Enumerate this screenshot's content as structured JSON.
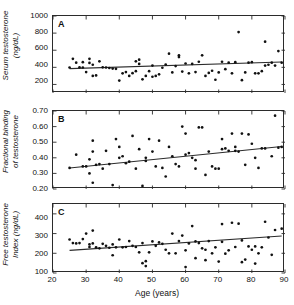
{
  "figure": {
    "xlabel": "Age (years)",
    "xticks": [
      20,
      30,
      40,
      50,
      60,
      70,
      80,
      90
    ],
    "xlim": [
      20,
      90
    ]
  },
  "chart_data": [
    {
      "type": "scatter",
      "panel": "A",
      "title": "",
      "xlabel": "Age (years)",
      "ylabel": "Serum testosterone (ng/dL)",
      "ylabel_line1": "Serum testosterone",
      "ylabel_line2": "(ng/dL)",
      "xlim": [
        20,
        90
      ],
      "ylim": [
        100,
        1000
      ],
      "yticks": [
        200,
        400,
        600,
        800,
        1000
      ],
      "grid": false,
      "legend": "none",
      "trendline": {
        "x": [
          25,
          89
        ],
        "y": [
          385,
          462
        ]
      },
      "points": [
        [
          25,
          398
        ],
        [
          26,
          500
        ],
        [
          27,
          455
        ],
        [
          28,
          400
        ],
        [
          29,
          460
        ],
        [
          29,
          398
        ],
        [
          30,
          345
        ],
        [
          31,
          500
        ],
        [
          31,
          452
        ],
        [
          32,
          430
        ],
        [
          32,
          300
        ],
        [
          33,
          305
        ],
        [
          34,
          470
        ],
        [
          35,
          400
        ],
        [
          36,
          398
        ],
        [
          37,
          392
        ],
        [
          38,
          385
        ],
        [
          39,
          382
        ],
        [
          40,
          245
        ],
        [
          41,
          330
        ],
        [
          42,
          345
        ],
        [
          43,
          300
        ],
        [
          44,
          332
        ],
        [
          45,
          355
        ],
        [
          45,
          470
        ],
        [
          46,
          490
        ],
        [
          46,
          440
        ],
        [
          47,
          260
        ],
        [
          48,
          300
        ],
        [
          49,
          355
        ],
        [
          50,
          290
        ],
        [
          50,
          420
        ],
        [
          51,
          300
        ],
        [
          52,
          318
        ],
        [
          53,
          395
        ],
        [
          54,
          432
        ],
        [
          55,
          560
        ],
        [
          56,
          340
        ],
        [
          57,
          415
        ],
        [
          58,
          520
        ],
        [
          58,
          540
        ],
        [
          59,
          350
        ],
        [
          60,
          445
        ],
        [
          61,
          330
        ],
        [
          62,
          440
        ],
        [
          63,
          345
        ],
        [
          64,
          465
        ],
        [
          65,
          540
        ],
        [
          66,
          300
        ],
        [
          67,
          335
        ],
        [
          68,
          360
        ],
        [
          69,
          255
        ],
        [
          70,
          340
        ],
        [
          71,
          465
        ],
        [
          72,
          378
        ],
        [
          73,
          455
        ],
        [
          74,
          330
        ],
        [
          75,
          460
        ],
        [
          76,
          812
        ],
        [
          77,
          250
        ],
        [
          78,
          340
        ],
        [
          79,
          455
        ],
        [
          80,
          460
        ],
        [
          81,
          330
        ],
        [
          82,
          330
        ],
        [
          83,
          355
        ],
        [
          84,
          700
        ],
        [
          84,
          420
        ],
        [
          85,
          430
        ],
        [
          86,
          455
        ],
        [
          87,
          420
        ],
        [
          88,
          590
        ],
        [
          89,
          455
        ]
      ]
    },
    {
      "type": "scatter",
      "panel": "B",
      "title": "",
      "xlabel": "Age (years)",
      "ylabel": "Fractional binding of testosterone",
      "ylabel_line1": "Fractional binding",
      "ylabel_line2": "of testosterone",
      "xlim": [
        20,
        90
      ],
      "ylim": [
        0.2,
        0.7
      ],
      "yticks": [
        "0.20",
        "0.30",
        "0.40",
        "0.50",
        "0.60",
        "0.70"
      ],
      "grid": false,
      "legend": "none",
      "trendline": {
        "x": [
          25,
          89
        ],
        "y": [
          0.335,
          0.472
        ]
      },
      "points": [
        [
          25,
          0.335
        ],
        [
          27,
          0.42
        ],
        [
          29,
          0.345
        ],
        [
          30,
          0.345
        ],
        [
          31,
          0.39
        ],
        [
          31,
          0.3
        ],
        [
          32,
          0.51
        ],
        [
          32,
          0.44
        ],
        [
          32,
          0.24
        ],
        [
          33,
          0.355
        ],
        [
          34,
          0.36
        ],
        [
          35,
          0.33
        ],
        [
          36,
          0.445
        ],
        [
          37,
          0.36
        ],
        [
          38,
          0.225
        ],
        [
          39,
          0.52
        ],
        [
          40,
          0.47
        ],
        [
          40,
          0.4
        ],
        [
          41,
          0.41
        ],
        [
          42,
          0.365
        ],
        [
          43,
          0.375
        ],
        [
          44,
          0.54
        ],
        [
          45,
          0.33
        ],
        [
          46,
          0.455
        ],
        [
          47,
          0.22
        ],
        [
          48,
          0.4
        ],
        [
          48,
          0.38
        ],
        [
          49,
          0.52
        ],
        [
          50,
          0.44
        ],
        [
          51,
          0.345
        ],
        [
          52,
          0.51
        ],
        [
          53,
          0.335
        ],
        [
          54,
          0.28
        ],
        [
          55,
          0.47
        ],
        [
          56,
          0.41
        ],
        [
          57,
          0.36
        ],
        [
          58,
          0.345
        ],
        [
          59,
          0.6
        ],
        [
          60,
          0.555
        ],
        [
          60,
          0.42
        ],
        [
          61,
          0.43
        ],
        [
          62,
          0.4
        ],
        [
          63,
          0.385
        ],
        [
          63,
          0.33
        ],
        [
          64,
          0.595
        ],
        [
          65,
          0.595
        ],
        [
          66,
          0.29
        ],
        [
          67,
          0.44
        ],
        [
          68,
          0.345
        ],
        [
          69,
          0.33
        ],
        [
          70,
          0.33
        ],
        [
          71,
          0.455
        ],
        [
          71,
          0.52
        ],
        [
          72,
          0.46
        ],
        [
          73,
          0.445
        ],
        [
          74,
          0.555
        ],
        [
          75,
          0.47
        ],
        [
          75,
          0.445
        ],
        [
          76,
          0.44
        ],
        [
          77,
          0.555
        ],
        [
          78,
          0.355
        ],
        [
          79,
          0.55
        ],
        [
          80,
          0.49
        ],
        [
          81,
          0.4
        ],
        [
          82,
          0.335
        ],
        [
          83,
          0.46
        ],
        [
          84,
          0.46
        ],
        [
          86,
          0.41
        ],
        [
          87,
          0.67
        ],
        [
          88,
          0.465
        ],
        [
          89,
          0.47
        ]
      ]
    },
    {
      "type": "scatter",
      "panel": "C",
      "title": "",
      "xlabel": "Age (years)",
      "ylabel": "Free testosterone Index (ng/dL)",
      "ylabel_line1": "Free testosterone",
      "ylabel_line2": "Index (ng/dL)",
      "xlim": [
        20,
        90
      ],
      "ylim": [
        100,
        450
      ],
      "yticks": [
        100,
        200,
        300,
        400
      ],
      "grid": false,
      "legend": "none",
      "trendline": {
        "x": [
          25,
          89
        ],
        "y": [
          215,
          288
        ]
      },
      "points": [
        [
          25,
          270
        ],
        [
          26,
          252
        ],
        [
          27,
          250
        ],
        [
          28,
          252
        ],
        [
          29,
          272
        ],
        [
          30,
          300
        ],
        [
          31,
          245
        ],
        [
          31,
          232
        ],
        [
          32,
          315
        ],
        [
          32,
          250
        ],
        [
          33,
          230
        ],
        [
          34,
          225
        ],
        [
          35,
          248
        ],
        [
          36,
          238
        ],
        [
          37,
          228
        ],
        [
          38,
          245
        ],
        [
          38,
          190
        ],
        [
          39,
          230
        ],
        [
          40,
          270
        ],
        [
          41,
          230
        ],
        [
          42,
          232
        ],
        [
          43,
          262
        ],
        [
          44,
          238
        ],
        [
          45,
          232
        ],
        [
          46,
          205
        ],
        [
          47,
          252
        ],
        [
          47,
          150
        ],
        [
          48,
          160
        ],
        [
          48,
          135
        ],
        [
          49,
          205
        ],
        [
          50,
          260
        ],
        [
          51,
          238
        ],
        [
          52,
          255
        ],
        [
          53,
          248
        ],
        [
          54,
          218
        ],
        [
          55,
          200
        ],
        [
          56,
          300
        ],
        [
          57,
          200
        ],
        [
          58,
          262
        ],
        [
          59,
          290
        ],
        [
          60,
          215
        ],
        [
          60,
          130
        ],
        [
          61,
          250
        ],
        [
          62,
          338
        ],
        [
          63,
          260
        ],
        [
          63,
          175
        ],
        [
          64,
          252
        ],
        [
          65,
          225
        ],
        [
          66,
          218
        ],
        [
          66,
          165
        ],
        [
          67,
          262
        ],
        [
          68,
          200
        ],
        [
          69,
          230
        ],
        [
          70,
          158
        ],
        [
          71,
          348
        ],
        [
          71,
          258
        ],
        [
          72,
          198
        ],
        [
          73,
          215
        ],
        [
          74,
          355
        ],
        [
          75,
          232
        ],
        [
          76,
          350
        ],
        [
          77,
          265
        ],
        [
          77,
          155
        ],
        [
          78,
          168
        ],
        [
          79,
          235
        ],
        [
          80,
          218
        ],
        [
          81,
          148
        ],
        [
          81,
          235
        ],
        [
          82,
          200
        ],
        [
          83,
          230
        ],
        [
          84,
          360
        ],
        [
          85,
          280
        ],
        [
          86,
          192
        ],
        [
          87,
          318
        ],
        [
          89,
          325
        ]
      ]
    }
  ]
}
